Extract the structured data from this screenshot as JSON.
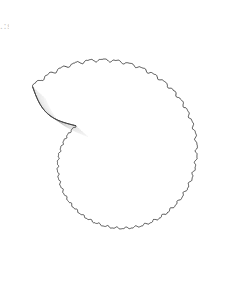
{
  "figure": {
    "kind": "scientific-illustration",
    "technique": "stipple-engraving",
    "orientation": "lateral-view-coiling-counterclockwise",
    "background_color": "#ffffff",
    "ink_color": "#5c5c5c",
    "outline_color": "#3a3a3a",
    "stipple_color": "#7d7d7d"
  },
  "geometry": {
    "canvas_width": 238,
    "canvas_height": 286,
    "center_x": 114,
    "center_y": 160,
    "outer_radius": 110,
    "umbilicus_radius": 7,
    "whorl_count": 3.6,
    "rib_count_outer_whorl": 46,
    "margin_scallop_count": 46,
    "bounds": {
      "left": 14,
      "top": 18,
      "right": 222,
      "bottom": 268
    }
  },
  "edge_artifacts": {
    "left_margin_text_fragments": ". : s e ."
  },
  "labels": {
    "figure_number": "",
    "caption": ""
  }
}
